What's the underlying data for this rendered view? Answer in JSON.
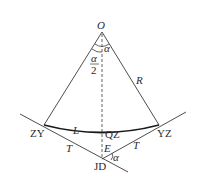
{
  "diagram": {
    "type": "circular-curve-geometry",
    "stroke_color": "#3a3a3a",
    "curve_color": "#1a1a1a",
    "labels": {
      "center": "O",
      "central_angle": "α",
      "half_angle_num": "α",
      "half_angle_den": "2",
      "radius": "R",
      "curve_start": "ZY",
      "curve_mid": "QZ",
      "curve_end": "YZ",
      "arc_length": "L",
      "tangent_left": "T",
      "tangent_right": "T",
      "external_distance": "E",
      "intersection": "JD",
      "deflection_angle": "α"
    },
    "points": {
      "O": [
        102,
        32
      ],
      "ZY": [
        44,
        125
      ],
      "QZ": [
        102,
        131
      ],
      "YZ": [
        159,
        125
      ],
      "JD": [
        102,
        159
      ]
    }
  }
}
